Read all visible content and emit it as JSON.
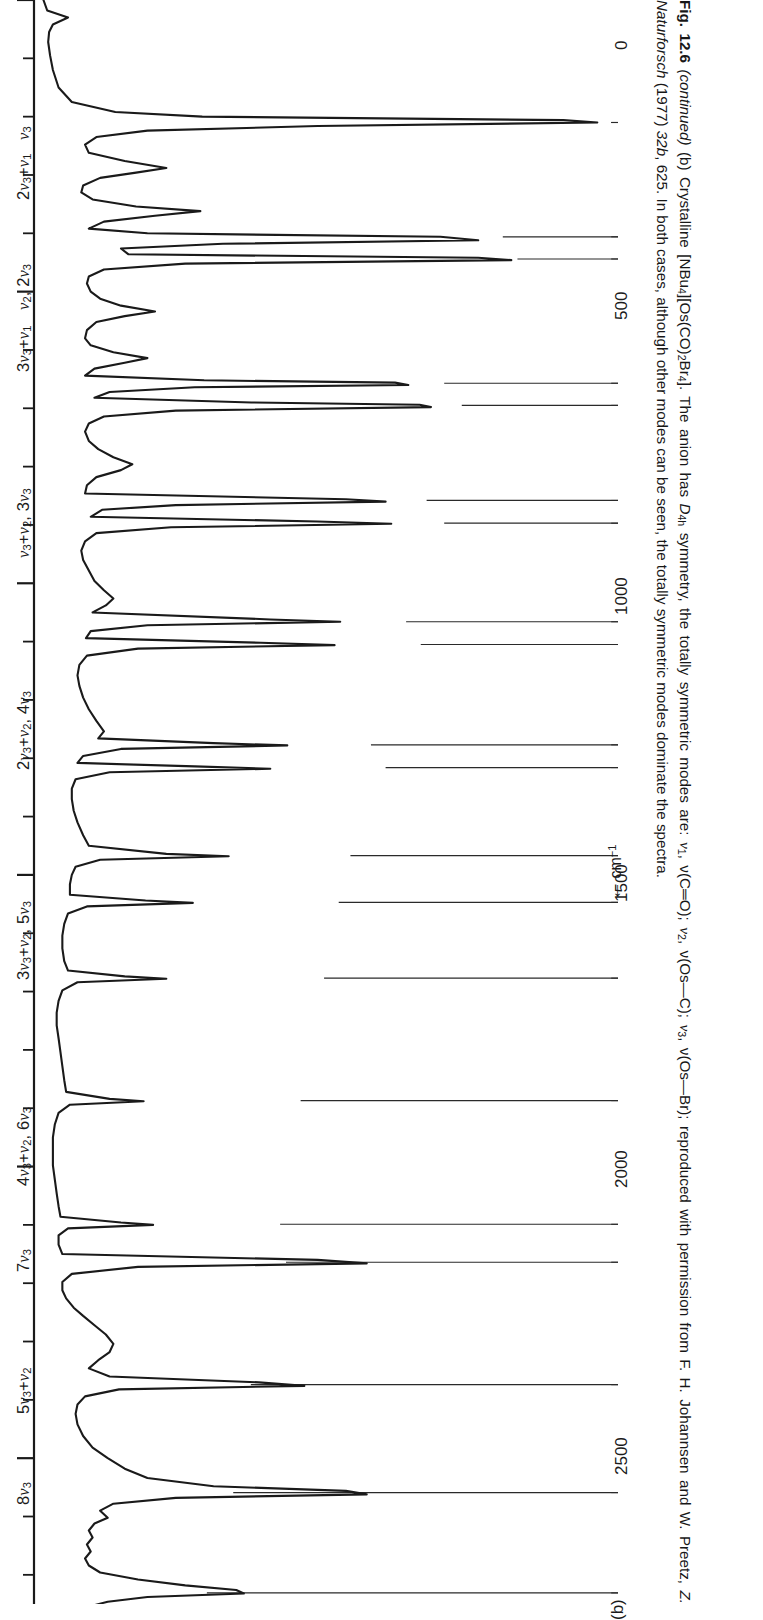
{
  "figure": {
    "panel_letter": "(b)",
    "axis": {
      "title_arrow": "←",
      "title": "cm",
      "title_exponent": "−1",
      "tick_labels": [
        "0",
        "500",
        "1000",
        "1500",
        "2000",
        "2500"
      ],
      "tick_values": [
        0,
        500,
        1000,
        1500,
        2000,
        2500
      ],
      "minor_tick_step": 100,
      "range_cm1": [
        0,
        2750
      ],
      "direction": "decreasing-to-the-right"
    },
    "peak_labels": [
      {
        "id": "v3",
        "text": "ν3",
        "html": "<i>ν</i><sub>3</sub>"
      },
      {
        "id": "v2-2v3",
        "text": "ν2, 2ν3",
        "html": "<i>ν</i><sub>2</sub>, 2<i>ν</i><sub>3</sub>"
      },
      {
        "id": "v3v2-3v3",
        "text": "ν3+ν2, 3ν3",
        "html": "<i>ν</i><sub>3</sub>+<i>ν</i><sub>2</sub>, 3<i>ν</i><sub>3</sub>"
      },
      {
        "id": "2v3v2-4v3",
        "text": "2ν3+ν2, 4ν3",
        "html": "2<i>ν</i><sub>3</sub>+<i>ν</i><sub>2</sub>, 4<i>ν</i><sub>3</sub>"
      },
      {
        "id": "3v3v2-5v3",
        "text": "3ν3+ν2, 5ν3",
        "html": "3<i>ν</i><sub>3</sub>+<i>ν</i><sub>2</sub>, 5<i>ν</i><sub>3</sub>"
      },
      {
        "id": "4v3v2-6v3",
        "text": "4ν3+ν2, 6ν3",
        "html": "4<i>ν</i><sub>3</sub>+<i>ν</i><sub>2</sub>, 6<i>ν</i><sub>3</sub>"
      },
      {
        "id": "7v3",
        "text": "7ν3",
        "html": "7<i>ν</i><sub>3</sub>"
      },
      {
        "id": "5v3v2",
        "text": "5ν3+ν2",
        "html": "5<i>ν</i><sub>3</sub>+<i>ν</i><sub>2</sub>"
      },
      {
        "id": "8v3",
        "text": "8ν3",
        "html": "8<i>ν</i><sub>3</sub>"
      },
      {
        "id": "9v3",
        "text": "9ν3",
        "html": "9<i>ν</i><sub>3</sub>"
      },
      {
        "id": "10v3",
        "text": "10ν3",
        "html": "10<i>ν</i><sub>3</sub>"
      },
      {
        "id": "v1",
        "text": "ν1",
        "html": "<i>ν</i><sub>1</sub>"
      },
      {
        "id": "v3v1",
        "text": "ν3+ν1",
        "html": "<i>ν</i><sub>3</sub>+<i>ν</i><sub>1</sub>"
      },
      {
        "id": "2v3v1",
        "text": "2ν3+ν1",
        "html": "2<i>ν</i><sub>3</sub>+<i>ν</i><sub>1</sub>"
      },
      {
        "id": "3v3v1",
        "text": "3ν3+ν1",
        "html": "3<i>ν</i><sub>3</sub>+<i>ν</i><sub>1</sub>"
      }
    ]
  },
  "caption": {
    "fig_number": "Fig. 12.6",
    "continued": "(continued)",
    "part": "(b)",
    "line1_a": "Crystalline [NBu",
    "line1_b": "][Os(CO)",
    "line1_c": "Br",
    "line1_d": "]. The anion has ",
    "symmetry": "D",
    "symmetry_sub": "4h",
    "line1_e": " symmetry, the totally symmetric modes are: ",
    "mode1": "ν",
    "mode1_sub": "1",
    "mode1_desc": ", ν(C═O); ",
    "mode2_sub": "2",
    "mode2_desc": ", ν(Os—C); ",
    "mode3_sub": "3",
    "mode3_desc": ", ν(Os—Br); reproduced with permission from F. H. Johannsen and W. Preetz, ",
    "journal": "Z. Naturforsch",
    "journal_rest": " (1977) ",
    "volume": "32b",
    "pages": ", 625. In both cases, although other modes can be seen, the totally symmetric modes dominate the spectra.",
    "subscripts": {
      "nbu": "4",
      "co": "2",
      "br": "4"
    }
  },
  "chart_data": {
    "type": "line",
    "xlabel": "cm⁻¹",
    "ylabel": "Intensity",
    "xlim": [
      0,
      2750
    ],
    "x_axis_inverted": true,
    "grid": false,
    "legend": null,
    "annotations": [
      {
        "label": "ν3",
        "cm1": 210,
        "kind": "peak"
      },
      {
        "label": "ν2, 2ν3",
        "cm1": 405,
        "kind": "peak-pair"
      },
      {
        "label": "ν2",
        "cm1": 440,
        "kind": "peak"
      },
      {
        "label": "ν3+ν2, 3ν3",
        "cm1": 650,
        "kind": "peak-pair"
      },
      {
        "label": "2ν3+ν2, 4ν3",
        "cm1": 855,
        "kind": "peak-pair"
      },
      {
        "label": "3ν3+ν2, 5ν3",
        "cm1": 1065,
        "kind": "peak-pair"
      },
      {
        "label": "4ν3+ν2, 6ν3",
        "cm1": 1275,
        "kind": "peak-pair"
      },
      {
        "label": "7ν3",
        "cm1": 1470,
        "kind": "peak"
      },
      {
        "label": "5ν3+ν2",
        "cm1": 1545,
        "kind": "peak"
      },
      {
        "label": "8ν3",
        "cm1": 1680,
        "kind": "peak"
      },
      {
        "label": "9ν3",
        "cm1": 1890,
        "kind": "peak"
      },
      {
        "label": "10ν3",
        "cm1": 2100,
        "kind": "peak"
      },
      {
        "label": "ν1",
        "cm1": 2165,
        "kind": "peak"
      },
      {
        "label": "ν3+ν1",
        "cm1": 2375,
        "kind": "peak"
      },
      {
        "label": "2ν3+ν1",
        "cm1": 2560,
        "kind": "peak"
      },
      {
        "label": "3ν3+ν1",
        "cm1": 2730,
        "kind": "peak"
      }
    ],
    "trace": [
      [
        0,
        10
      ],
      [
        18,
        14
      ],
      [
        30,
        36
      ],
      [
        42,
        20
      ],
      [
        55,
        16
      ],
      [
        72,
        15
      ],
      [
        95,
        17
      ],
      [
        120,
        20
      ],
      [
        150,
        26
      ],
      [
        175,
        40
      ],
      [
        192,
        86
      ],
      [
        200,
        178
      ],
      [
        206,
        560
      ],
      [
        210,
        596
      ],
      [
        216,
        300
      ],
      [
        224,
        120
      ],
      [
        235,
        66
      ],
      [
        248,
        54
      ],
      [
        262,
        58
      ],
      [
        276,
        96
      ],
      [
        288,
        140
      ],
      [
        296,
        108
      ],
      [
        305,
        70
      ],
      [
        318,
        52
      ],
      [
        330,
        50
      ],
      [
        342,
        62
      ],
      [
        354,
        108
      ],
      [
        362,
        176
      ],
      [
        370,
        128
      ],
      [
        380,
        74
      ],
      [
        392,
        58
      ],
      [
        400,
        120
      ],
      [
        406,
        430
      ],
      [
        412,
        470
      ],
      [
        418,
        200
      ],
      [
        426,
        92
      ],
      [
        436,
        100
      ],
      [
        442,
        470
      ],
      [
        446,
        505
      ],
      [
        452,
        160
      ],
      [
        462,
        74
      ],
      [
        474,
        58
      ],
      [
        486,
        56
      ],
      [
        500,
        60
      ],
      [
        512,
        70
      ],
      [
        524,
        92
      ],
      [
        534,
        128
      ],
      [
        542,
        96
      ],
      [
        552,
        66
      ],
      [
        566,
        56
      ],
      [
        580,
        54
      ],
      [
        592,
        60
      ],
      [
        604,
        84
      ],
      [
        614,
        120
      ],
      [
        622,
        96
      ],
      [
        632,
        64
      ],
      [
        644,
        54
      ],
      [
        652,
        180
      ],
      [
        656,
        382
      ],
      [
        660,
        396
      ],
      [
        664,
        170
      ],
      [
        672,
        80
      ],
      [
        682,
        64
      ],
      [
        690,
        230
      ],
      [
        694,
        408
      ],
      [
        698,
        420
      ],
      [
        704,
        150
      ],
      [
        714,
        74
      ],
      [
        726,
        58
      ],
      [
        740,
        54
      ],
      [
        756,
        58
      ],
      [
        770,
        68
      ],
      [
        784,
        84
      ],
      [
        796,
        104
      ],
      [
        806,
        92
      ],
      [
        818,
        66
      ],
      [
        832,
        56
      ],
      [
        846,
        54
      ],
      [
        856,
        330
      ],
      [
        860,
        372
      ],
      [
        866,
        150
      ],
      [
        874,
        72
      ],
      [
        886,
        60
      ],
      [
        894,
        300
      ],
      [
        898,
        378
      ],
      [
        904,
        145
      ],
      [
        914,
        66
      ],
      [
        928,
        54
      ],
      [
        944,
        50
      ],
      [
        960,
        52
      ],
      [
        978,
        58
      ],
      [
        996,
        64
      ],
      [
        1012,
        74
      ],
      [
        1026,
        84
      ],
      [
        1038,
        76
      ],
      [
        1050,
        62
      ],
      [
        1062,
        250
      ],
      [
        1066,
        324
      ],
      [
        1072,
        120
      ],
      [
        1082,
        60
      ],
      [
        1094,
        55
      ],
      [
        1102,
        240
      ],
      [
        1106,
        318
      ],
      [
        1112,
        110
      ],
      [
        1124,
        56
      ],
      [
        1140,
        48
      ],
      [
        1158,
        46
      ],
      [
        1176,
        48
      ],
      [
        1196,
        52
      ],
      [
        1216,
        58
      ],
      [
        1236,
        66
      ],
      [
        1254,
        74
      ],
      [
        1266,
        68
      ],
      [
        1274,
        190
      ],
      [
        1278,
        268
      ],
      [
        1284,
        92
      ],
      [
        1296,
        52
      ],
      [
        1308,
        46
      ],
      [
        1314,
        170
      ],
      [
        1318,
        250
      ],
      [
        1324,
        80
      ],
      [
        1336,
        44
      ],
      [
        1352,
        40
      ],
      [
        1370,
        40
      ],
      [
        1390,
        42
      ],
      [
        1410,
        46
      ],
      [
        1432,
        52
      ],
      [
        1450,
        58
      ],
      [
        1464,
        140
      ],
      [
        1468,
        206
      ],
      [
        1474,
        70
      ],
      [
        1486,
        44
      ],
      [
        1500,
        40
      ],
      [
        1516,
        38
      ],
      [
        1534,
        38
      ],
      [
        1544,
        118
      ],
      [
        1548,
        168
      ],
      [
        1554,
        56
      ],
      [
        1566,
        36
      ],
      [
        1584,
        32
      ],
      [
        1604,
        30
      ],
      [
        1626,
        30
      ],
      [
        1648,
        32
      ],
      [
        1664,
        36
      ],
      [
        1674,
        96
      ],
      [
        1678,
        140
      ],
      [
        1684,
        46
      ],
      [
        1698,
        30
      ],
      [
        1716,
        26
      ],
      [
        1736,
        24
      ],
      [
        1758,
        24
      ],
      [
        1780,
        26
      ],
      [
        1804,
        28
      ],
      [
        1828,
        30
      ],
      [
        1852,
        32
      ],
      [
        1872,
        34
      ],
      [
        1884,
        80
      ],
      [
        1888,
        116
      ],
      [
        1894,
        38
      ],
      [
        1908,
        26
      ],
      [
        1928,
        22
      ],
      [
        1950,
        20
      ],
      [
        1974,
        20
      ],
      [
        1998,
        20
      ],
      [
        2022,
        22
      ],
      [
        2046,
        24
      ],
      [
        2068,
        26
      ],
      [
        2086,
        28
      ],
      [
        2096,
        92
      ],
      [
        2100,
        126
      ],
      [
        2106,
        36
      ],
      [
        2118,
        26
      ],
      [
        2134,
        26
      ],
      [
        2150,
        30
      ],
      [
        2160,
        300
      ],
      [
        2166,
        352
      ],
      [
        2172,
        110
      ],
      [
        2184,
        40
      ],
      [
        2198,
        30
      ],
      [
        2212,
        30
      ],
      [
        2226,
        34
      ],
      [
        2242,
        42
      ],
      [
        2256,
        52
      ],
      [
        2272,
        64
      ],
      [
        2288,
        76
      ],
      [
        2304,
        84
      ],
      [
        2318,
        80
      ],
      [
        2332,
        68
      ],
      [
        2346,
        58
      ],
      [
        2360,
        80
      ],
      [
        2370,
        238
      ],
      [
        2376,
        286
      ],
      [
        2382,
        90
      ],
      [
        2394,
        54
      ],
      [
        2408,
        46
      ],
      [
        2424,
        44
      ],
      [
        2442,
        46
      ],
      [
        2462,
        52
      ],
      [
        2482,
        62
      ],
      [
        2500,
        78
      ],
      [
        2518,
        96
      ],
      [
        2534,
        120
      ],
      [
        2548,
        190
      ],
      [
        2556,
        330
      ],
      [
        2562,
        352
      ],
      [
        2568,
        150
      ],
      [
        2578,
        84
      ],
      [
        2590,
        70
      ],
      [
        2602,
        78
      ],
      [
        2612,
        64
      ],
      [
        2624,
        58
      ],
      [
        2636,
        62
      ],
      [
        2648,
        56
      ],
      [
        2660,
        60
      ],
      [
        2672,
        54
      ],
      [
        2684,
        58
      ],
      [
        2696,
        70
      ],
      [
        2708,
        110
      ],
      [
        2718,
        160
      ],
      [
        2726,
        214
      ],
      [
        2732,
        222
      ],
      [
        2738,
        120
      ],
      [
        2746,
        78
      ],
      [
        2752,
        64
      ],
      [
        2760,
        86
      ],
      [
        2766,
        70
      ],
      [
        2772,
        96
      ],
      [
        2778,
        74
      ]
    ]
  }
}
